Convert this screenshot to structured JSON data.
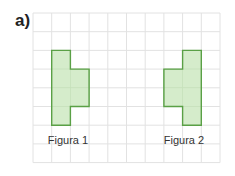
{
  "title": "a)",
  "grid": {
    "x0": 33,
    "y0": 13,
    "cell": 18.7,
    "cols": 10,
    "rows": 8,
    "line_color": "#e2e2e2"
  },
  "figures": [
    {
      "label": "Figura 1",
      "fill": "#d5eccb",
      "stroke": "#5aa046",
      "cells": [
        [
          1,
          2
        ],
        [
          1,
          3
        ],
        [
          1,
          4
        ],
        [
          1,
          5
        ],
        [
          2,
          3
        ],
        [
          2,
          4
        ]
      ]
    },
    {
      "label": "Figura 2",
      "fill": "#d5eccb",
      "stroke": "#5aa046",
      "cells": [
        [
          8,
          2
        ],
        [
          8,
          3
        ],
        [
          8,
          4
        ],
        [
          8,
          5
        ],
        [
          7,
          3
        ],
        [
          7,
          4
        ]
      ]
    }
  ]
}
